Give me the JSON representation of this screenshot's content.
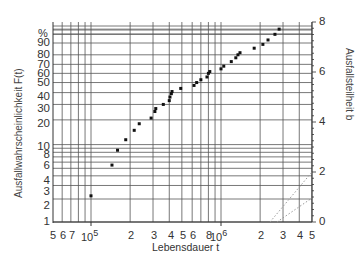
{
  "chart_data": {
    "type": "scatter",
    "title": "",
    "xlabel": "Lebensdauer t",
    "ylabel": "Ausfallwahrscheinlichkeit F(t)",
    "ylabel_right": "Ausfallsteilheit b",
    "xscale": "log",
    "yscale": "weibull",
    "xlim": [
      50000,
      5000000
    ],
    "ylim_percent": [
      1,
      99.9
    ],
    "ylim_right": [
      0,
      8
    ],
    "grid": true,
    "legend": null,
    "x_tick_labels": [
      "5",
      "6",
      "7",
      "10^5",
      "2",
      "3",
      "4",
      "5",
      "6",
      "8",
      "10^6",
      "2",
      "3",
      "4",
      "5"
    ],
    "y_tick_labels_left": [
      "%",
      "90",
      "80",
      "70",
      "60",
      "50",
      "40",
      "30",
      "20",
      "10",
      "8",
      "6",
      "4",
      "3",
      "2",
      "1"
    ],
    "y_tick_labels_right": [
      "8",
      "6",
      "4",
      "2",
      "0"
    ],
    "series": [
      {
        "name": "Ausfaelle",
        "points": [
          {
            "x": 100000,
            "y": 2.2
          },
          {
            "x": 145000,
            "y": 5.5
          },
          {
            "x": 160000,
            "y": 8.5
          },
          {
            "x": 185000,
            "y": 11.5
          },
          {
            "x": 215000,
            "y": 15
          },
          {
            "x": 235000,
            "y": 18
          },
          {
            "x": 290000,
            "y": 21
          },
          {
            "x": 310000,
            "y": 25
          },
          {
            "x": 315000,
            "y": 27
          },
          {
            "x": 360000,
            "y": 30
          },
          {
            "x": 400000,
            "y": 33
          },
          {
            "x": 405000,
            "y": 36
          },
          {
            "x": 415000,
            "y": 39
          },
          {
            "x": 420000,
            "y": 41
          },
          {
            "x": 490000,
            "y": 44
          },
          {
            "x": 620000,
            "y": 47
          },
          {
            "x": 650000,
            "y": 50
          },
          {
            "x": 700000,
            "y": 53
          },
          {
            "x": 780000,
            "y": 56
          },
          {
            "x": 800000,
            "y": 60
          },
          {
            "x": 820000,
            "y": 62
          },
          {
            "x": 1000000,
            "y": 65
          },
          {
            "x": 1050000,
            "y": 68
          },
          {
            "x": 1200000,
            "y": 73
          },
          {
            "x": 1300000,
            "y": 77
          },
          {
            "x": 1350000,
            "y": 80
          },
          {
            "x": 1400000,
            "y": 82
          },
          {
            "x": 1800000,
            "y": 86
          },
          {
            "x": 2100000,
            "y": 89
          },
          {
            "x": 2300000,
            "y": 92
          },
          {
            "x": 2600000,
            "y": 95
          },
          {
            "x": 2800000,
            "y": 97
          }
        ]
      }
    ],
    "reference_lines": [
      {
        "style": "dotted",
        "from_px": [
          270,
          222
        ],
        "to_px": [
          312,
          172
        ]
      },
      {
        "style": "dotted",
        "from_px": [
          277,
          222
        ],
        "to_px": [
          312,
          198
        ]
      }
    ]
  },
  "labels": {
    "xlabel": "Lebensdauer t",
    "ylabel_left": "Ausfallwahrscheinlichkeit F(t)",
    "ylabel_right": "Ausfallsteilheit b",
    "pct": "%",
    "ylab_left": [
      {
        "t": "90",
        "y": 43
      },
      {
        "t": "80",
        "y": 55
      },
      {
        "t": "70",
        "y": 65
      },
      {
        "t": "60",
        "y": 74
      },
      {
        "t": "50",
        "y": 83
      },
      {
        "t": "40",
        "y": 97
      },
      {
        "t": "30",
        "y": 109
      },
      {
        "t": "20",
        "y": 124
      },
      {
        "t": "10",
        "y": 147
      },
      {
        "t": "8",
        "y": 155
      },
      {
        "t": "6",
        "y": 166
      },
      {
        "t": "4",
        "y": 181
      },
      {
        "t": "3",
        "y": 192
      },
      {
        "t": "2",
        "y": 206
      },
      {
        "t": "1",
        "y": 222
      }
    ],
    "ylab_right": [
      {
        "t": "8",
        "y": 22
      },
      {
        "t": "6",
        "y": 72
      },
      {
        "t": "4",
        "y": 122
      },
      {
        "t": "2",
        "y": 172
      },
      {
        "t": "0",
        "y": 222
      }
    ],
    "xlab": [
      {
        "t": "5",
        "x": 53
      },
      {
        "t": "6",
        "x": 63
      },
      {
        "t": "7",
        "x": 72
      },
      {
        "t": "2",
        "x": 131
      },
      {
        "t": "3",
        "x": 154
      },
      {
        "t": "4",
        "x": 171
      },
      {
        "t": "5",
        "x": 183
      },
      {
        "t": "6",
        "x": 193
      },
      {
        "t": "8",
        "x": 209
      },
      {
        "t": "2",
        "x": 261
      },
      {
        "t": "3",
        "x": 283
      },
      {
        "t": "4",
        "x": 300
      },
      {
        "t": "5",
        "x": 312
      }
    ],
    "x_decade_5_base": "10",
    "x_decade_5_exp": "5",
    "x_decade_6_base": "10",
    "x_decade_6_exp": "6"
  },
  "colors": {
    "grid": "#555555",
    "axis": "#333333",
    "points": "#111111",
    "ref_lines": "#999999"
  }
}
